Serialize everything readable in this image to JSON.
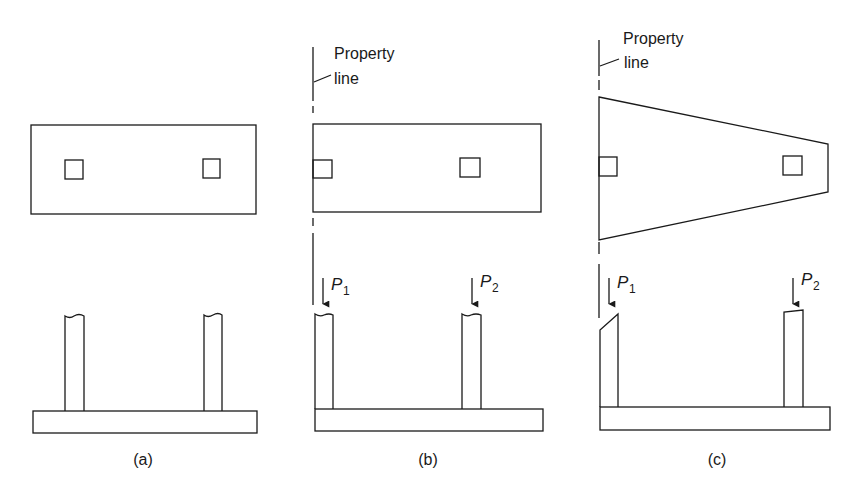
{
  "figure": {
    "panels": [
      {
        "id": "a",
        "caption": "(a)",
        "description": "Rectangular combined footing, columns symmetric"
      },
      {
        "id": "b",
        "caption": "(b)",
        "description": "Rectangular combined footing with exterior column at property line",
        "property_line_label_1": "Property",
        "property_line_label_2": "line",
        "load_1": "P",
        "load_1_sub": "1",
        "load_2": "P",
        "load_2_sub": "2"
      },
      {
        "id": "c",
        "caption": "(c)",
        "description": "Trapezoidal combined footing with exterior column at property line",
        "property_line_label_1": "Property",
        "property_line_label_2": "line",
        "load_1": "P",
        "load_1_sub": "1",
        "load_2": "P",
        "load_2_sub": "2"
      }
    ],
    "colors": {
      "line": "#1a1a1a",
      "background": "#ffffff"
    }
  }
}
